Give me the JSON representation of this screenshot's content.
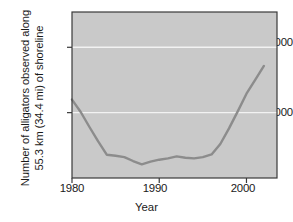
{
  "chart_data": {
    "type": "line",
    "title": "",
    "xlabel": "Year",
    "ylabel": "Number of alligators observed along 55.3 km (34.4 mi) of shoreline",
    "ylabel_lines": [
      "Number of alligators observed along",
      "55.3 km (34.4 mi) of shoreline"
    ],
    "x": [
      1980,
      1981,
      1982,
      1983,
      1984,
      1985,
      1986,
      1987,
      1988,
      1989,
      1990,
      1991,
      1992,
      1993,
      1994,
      1995,
      1996,
      1997,
      1998,
      1999,
      2000,
      2001,
      2002
    ],
    "values": [
      1200,
      1010,
      780,
      560,
      355,
      340,
      320,
      260,
      210,
      250,
      280,
      300,
      330,
      310,
      300,
      320,
      360,
      520,
      760,
      1020,
      1290,
      1500,
      1715
    ],
    "series": [
      {
        "name": "Alligators observed",
        "values": [
          1200,
          1010,
          780,
          560,
          355,
          340,
          320,
          260,
          210,
          250,
          280,
          300,
          330,
          310,
          300,
          320,
          360,
          520,
          760,
          1020,
          1290,
          1500,
          1715
        ]
      }
    ],
    "xlim": [
      1980,
      2003.5
    ],
    "ylim": [
      0,
      2540
    ],
    "xticks": [
      1980,
      1990,
      2000
    ],
    "xtick_labels": [
      "1980",
      "1990",
      "2000"
    ],
    "yticks": [
      1000,
      2000
    ],
    "ytick_labels": [
      "1000",
      "2000"
    ],
    "grid": "horizontal-white-on-gray",
    "legend": "none",
    "colors": {
      "plot_background": "#c9c9c9",
      "gridline": "#f2f2f2",
      "line": "#8c8c8c",
      "axis": "#3a3a3a",
      "text": "#1a1a1a",
      "figure_background": "#ffffff"
    }
  },
  "axes": {
    "y_tick_2000": "2000",
    "y_tick_1000": "1000",
    "x_tick_1980": "1980",
    "x_tick_1990": "1990",
    "x_tick_2000": "2000",
    "x_title": "Year",
    "y_title_line1": "Number of alligators observed along",
    "y_title_line2": "55.3 km (34.4 mi) of shoreline"
  }
}
